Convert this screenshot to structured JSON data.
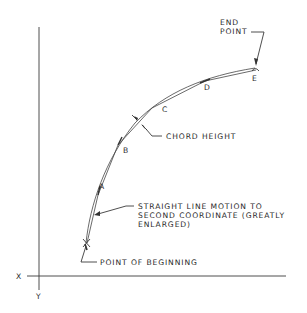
{
  "axes": {
    "x_label": "X",
    "y_label": "Y"
  },
  "points": {
    "a": "A",
    "b": "B",
    "c": "C",
    "d": "D",
    "e": "E"
  },
  "callouts": {
    "end_point_line1": "END",
    "end_point_line2": "POINT",
    "chord_height": "CHORD HEIGHT",
    "straight_line_1": "STRAIGHT LINE MOTION TO",
    "straight_line_2": "SECOND COORDINATE (GREATLY",
    "straight_line_3": "ENLARGED)",
    "point_of_beginning": "POINT OF BEGINNING"
  },
  "colors": {
    "line": "#3a3a3a",
    "background": "#ffffff"
  }
}
